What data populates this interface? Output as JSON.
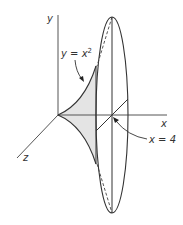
{
  "figure": {
    "axes": {
      "x_label": "x",
      "y_label": "y",
      "z_label": "z"
    },
    "annotations": {
      "curve_label_lhs": "y = x",
      "curve_label_exp": "2",
      "plane_label": "x = 4"
    },
    "colors": {
      "stroke": "#3a3a3a",
      "shade": "#e4e4e4",
      "background": "#ffffff"
    }
  }
}
